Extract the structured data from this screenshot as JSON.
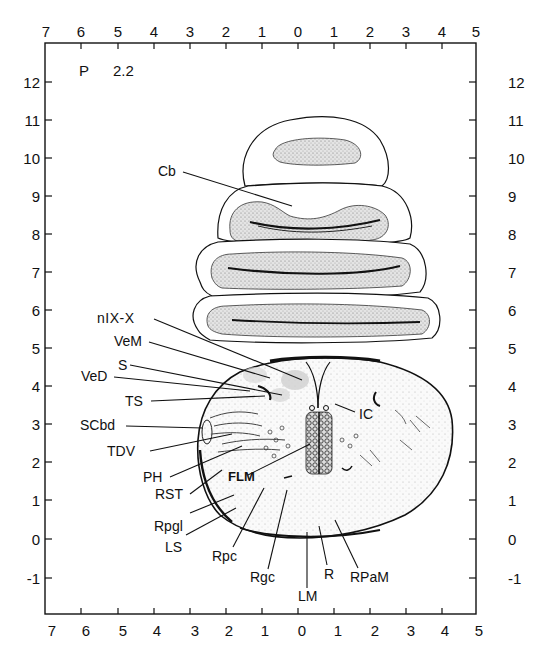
{
  "plate": {
    "prefix": "P",
    "number": "2.2"
  },
  "x_axis": {
    "top_labels": [
      "7",
      "6",
      "5",
      "4",
      "3",
      "2",
      "1",
      "0",
      "1",
      "2",
      "3",
      "4",
      "5"
    ],
    "bottom_labels": [
      "7",
      "6",
      "5",
      "4",
      "3",
      "2",
      "1",
      "0",
      "1",
      "2",
      "3",
      "4",
      "5"
    ]
  },
  "y_axis": {
    "left_labels": [
      "12",
      "11",
      "10",
      "9",
      "8",
      "7",
      "6",
      "5",
      "4",
      "3",
      "2",
      "1",
      "0",
      "-1"
    ],
    "right_labels": [
      "12",
      "11",
      "10",
      "9",
      "8",
      "7",
      "6",
      "5",
      "4",
      "3",
      "2",
      "1",
      "0",
      "-1"
    ]
  },
  "labels": {
    "cb": "Cb",
    "n9_10": "nIX-X",
    "vem": "VeM",
    "s": "S",
    "ved": "VeD",
    "ts": "TS",
    "scbd": "SCbd",
    "tdv": "TDV",
    "ph": "PH",
    "rst": "RST",
    "rpgl": "Rpgl",
    "ls": "LS",
    "rpc": "Rpc",
    "rgc": "Rgc",
    "lm": "LM",
    "r": "R",
    "rpam": "RPaM",
    "flm": "FLM",
    "ic": "IC"
  },
  "colors": {
    "ink": "#111111",
    "stipple": "#d9d9d9",
    "background": "#ffffff"
  }
}
